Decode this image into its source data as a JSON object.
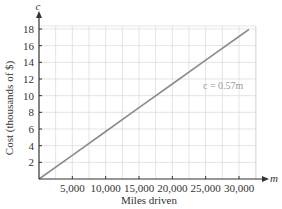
{
  "chart_data": {
    "type": "line",
    "title": "",
    "xlabel": "Miles driven",
    "ylabel": "Cost (thousands of $)",
    "x_axis_var": "m",
    "y_axis_var": "c",
    "xlim": [
      0,
      32500
    ],
    "ylim": [
      0,
      18
    ],
    "x_ticks": [
      5000,
      10000,
      15000,
      20000,
      25000,
      30000
    ],
    "x_tick_labels": [
      "5,000",
      "10,000",
      "15,000",
      "20,000",
      "25,000",
      "30,000"
    ],
    "y_ticks": [
      2,
      4,
      6,
      8,
      10,
      12,
      14,
      16,
      18
    ],
    "y_tick_labels": [
      "2",
      "4",
      "6",
      "8",
      "10",
      "12",
      "14",
      "16",
      "18"
    ],
    "grid": true,
    "series": [
      {
        "name": "c = 0.57m",
        "x": [
          0,
          5000,
          10000,
          15000,
          20000,
          25000,
          30000,
          31500
        ],
        "values": [
          0,
          2.85,
          5.7,
          8.55,
          11.4,
          14.25,
          17.1,
          17.96
        ]
      }
    ],
    "annotations": [
      {
        "text": "c = 0.57m",
        "x": 24000,
        "y": 11.7
      }
    ],
    "colors": {
      "line": "#8c8c8c",
      "grid": "#d9d9d9",
      "axis": "#333333",
      "annotation": "#9a9a9a"
    }
  }
}
